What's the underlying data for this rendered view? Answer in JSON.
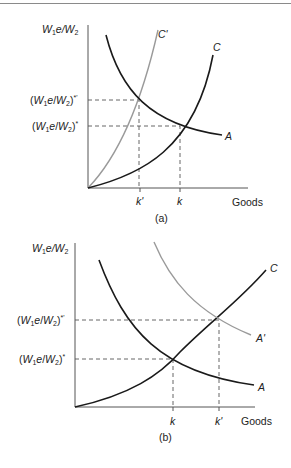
{
  "figure": {
    "panels": [
      {
        "id": "a",
        "caption": "(a)",
        "y_axis_label": "W1e/W2",
        "x_axis_label": "Goods",
        "y_levels": [
          "(W1e/W2)*'",
          "(W1e/W2)*"
        ],
        "x_ticks": [
          "k'",
          "k"
        ],
        "curves": [
          {
            "name": "C'",
            "color": "#9a9a9a",
            "kind": "cost (shifted)"
          },
          {
            "name": "C",
            "color": "#1a1a1a",
            "kind": "cost"
          },
          {
            "name": "A",
            "color": "#1a1a1a",
            "kind": "productivity"
          }
        ]
      },
      {
        "id": "b",
        "caption": "(b)",
        "y_axis_label": "W1e/W2",
        "x_axis_label": "Goods",
        "y_levels": [
          "(W1e/W2)*'",
          "(W1e/W2)*"
        ],
        "x_ticks": [
          "k",
          "k'"
        ],
        "curves": [
          {
            "name": "C",
            "color": "#1a1a1a",
            "kind": "cost"
          },
          {
            "name": "A'",
            "color": "#9a9a9a",
            "kind": "productivity (shifted)"
          },
          {
            "name": "A",
            "color": "#1a1a1a",
            "kind": "productivity"
          }
        ]
      }
    ]
  },
  "labels": {
    "a": {
      "y_axis": {
        "W": "W",
        "sub1": "1",
        "e": "e/W",
        "sub2": "2"
      },
      "level_high_suffix": "*'",
      "level_low_suffix": "*",
      "tick1": "k'",
      "tick2": "k",
      "goods": "Goods",
      "caption": "(a)",
      "curve_c_prime": "C'",
      "curve_c": "C",
      "curve_a": "A"
    },
    "b": {
      "level_high_suffix": "*'",
      "level_low_suffix": "*",
      "tick1": "k",
      "tick2": "k'",
      "goods": "Goods",
      "caption": "(b)",
      "curve_c": "C",
      "curve_a_prime": "A'",
      "curve_a": "A"
    }
  }
}
